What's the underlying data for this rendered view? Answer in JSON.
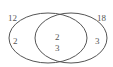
{
  "venn": {
    "set_a_label": "12",
    "set_b_label": "18",
    "only_a": "2",
    "intersection_top": "2",
    "intersection_bottom": "3",
    "only_b": "3"
  },
  "colors": {
    "stroke": "#555555",
    "text": "#555555",
    "background": "#ffffff"
  }
}
